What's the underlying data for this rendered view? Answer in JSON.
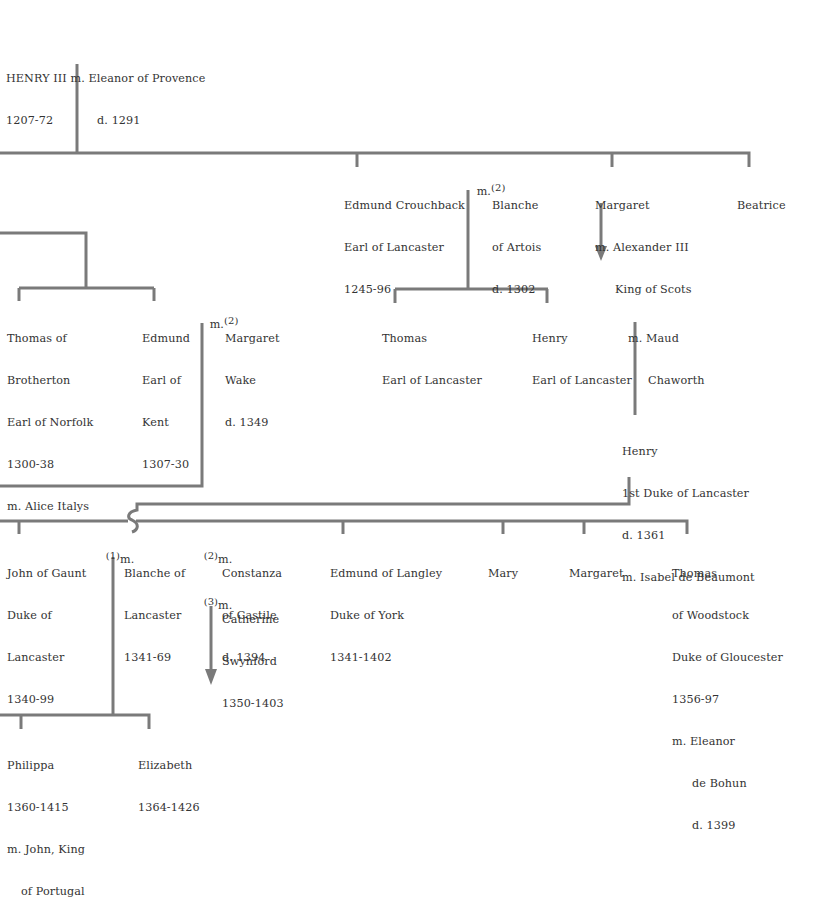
{
  "line_color": "#7a7a7a",
  "text_color": "#333333",
  "people": {
    "henry3": {
      "lines": [
        "HENRY III m. Eleanor of Provence",
        "1207-72            d. 1291"
      ]
    },
    "edmund_crouchback": {
      "name": "Edmund Crouchback",
      "lines": [
        "Earl of Lancaster",
        "1245-96"
      ]
    },
    "blanche_artois": {
      "marriage_prefix": "m.",
      "marriage_num": "(2)",
      "lines": [
        "Blanche",
        "of Artois",
        "d. 1302"
      ]
    },
    "margaret_scots": {
      "lines": [
        "Margaret",
        "m. Alexander III",
        "King of Scots"
      ]
    },
    "beatrice": {
      "lines": [
        "Beatrice"
      ]
    },
    "thomas_brotherton": {
      "lines": [
        "Thomas of",
        "Brotherton",
        "Earl of Norfolk",
        "1300-38",
        "m. Alice Italys"
      ]
    },
    "edmund_kent": {
      "lines": [
        "Edmund",
        "Earl of",
        "Kent",
        "1307-30"
      ]
    },
    "margaret_wake": {
      "marriage_prefix": "m.",
      "marriage_num": "(2)",
      "lines": [
        "Margaret",
        "Wake",
        "d. 1349"
      ]
    },
    "thomas_lancaster": {
      "lines": [
        "Thomas",
        "Earl of Lancaster"
      ]
    },
    "henry_lancaster": {
      "lines": [
        "Henry",
        "Earl of Lancaster"
      ]
    },
    "maud_chaworth": {
      "lines": [
        "m. Maud",
        "Chaworth"
      ]
    },
    "henry_1st_duke": {
      "lines": [
        "Henry",
        "1st Duke of Lancaster",
        "d. 1361",
        "m. Isabel de Beaumont"
      ]
    },
    "john_gaunt": {
      "lines": [
        "John of Gaunt",
        "Duke of",
        "Lancaster",
        "1340-99"
      ]
    },
    "blanche_lancaster": {
      "marriage_num": "(1)",
      "marriage_prefix": "m.",
      "lines": [
        "Blanche of",
        "Lancaster",
        "1341-69"
      ]
    },
    "constanza": {
      "marriage_num": "(2)",
      "marriage_prefix": "m.",
      "lines": [
        "Constanza",
        "of Castile",
        "d. 1394"
      ]
    },
    "catherine": {
      "marriage_num": "(3)",
      "marriage_prefix": "m.",
      "lines": [
        "Catherine",
        "Swynford",
        "1350-1403"
      ]
    },
    "edmund_langley": {
      "lines": [
        "Edmund of Langley",
        "Duke of York",
        "1341-1402"
      ]
    },
    "mary": {
      "lines": [
        "Mary"
      ]
    },
    "margaret2": {
      "lines": [
        "Margaret"
      ]
    },
    "thomas_woodstock": {
      "lines": [
        "Thomas",
        "of Woodstock",
        "Duke of Gloucester",
        "1356-97",
        "m. Eleanor",
        "de Bohun",
        "d. 1399"
      ]
    },
    "philippa": {
      "lines": [
        "Philippa",
        "1360-1415",
        "m. John, King",
        "of Portugal"
      ]
    },
    "elizabeth": {
      "lines": [
        "Elizabeth",
        "1364-1426"
      ]
    }
  }
}
